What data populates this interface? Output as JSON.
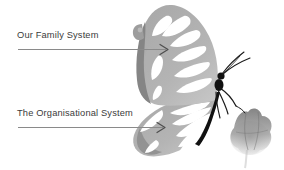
{
  "canvas": {
    "width": 284,
    "height": 170,
    "background_color": "#ffffff"
  },
  "annotations": [
    {
      "id": "family",
      "label": "Our Family System",
      "text_color": "#3b3b3b",
      "leader_line_color": "#8a8a8a",
      "arrow_color": "#555555",
      "points_to": "upper-wing"
    },
    {
      "id": "organisational",
      "label": "The Organisational System",
      "text_color": "#3b3b3b",
      "leader_line_color": "#8a8a8a",
      "arrow_color": "#555555",
      "points_to": "lower-wing"
    }
  ],
  "illustration": {
    "name": "butterfly-on-flower",
    "description": "Grayscale butterfly with veined translucent wings perched on a soft gray flower",
    "colors": {
      "wing_mid_gray": "#9a9a9a",
      "wing_light_gray": "#c9c9c9",
      "wing_pale": "#e3e3e3",
      "wing_edge_dark": "#7d7d7d",
      "vein_white": "#ffffff",
      "body_black": "#111111",
      "flower_gray": "#8f8f8f",
      "flower_pale": "#cfcfcf"
    },
    "parts": [
      "forewing",
      "hindwing",
      "body",
      "antennae",
      "legs",
      "flower"
    ]
  }
}
